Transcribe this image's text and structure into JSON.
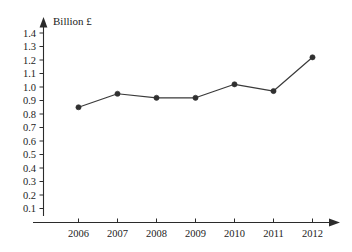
{
  "chart_data": {
    "type": "line",
    "title": "",
    "subtitle": "",
    "xlabel": "",
    "ylabel": "Billion £",
    "ylabel_position": "above-y-axis",
    "categories": [
      "2006",
      "2007",
      "2008",
      "2009",
      "2010",
      "2011",
      "2012"
    ],
    "x": [
      2006,
      2007,
      2008,
      2009,
      2010,
      2011,
      2012
    ],
    "values": [
      0.85,
      0.95,
      0.92,
      0.92,
      1.02,
      0.97,
      1.22
    ],
    "series": [
      {
        "name": "Billion £",
        "values": [
          0.85,
          0.95,
          0.92,
          0.92,
          1.02,
          0.97,
          1.22
        ]
      }
    ],
    "ylim": [
      0,
      1.45
    ],
    "xlim": [
      2005.4,
      2012.8
    ],
    "y_ticks": [
      0.1,
      0.2,
      0.3,
      0.4,
      0.5,
      0.6,
      0.7,
      0.8,
      0.9,
      1.0,
      1.1,
      1.2,
      1.3,
      1.4
    ],
    "y_tick_labels": [
      "0.1",
      "0.2",
      "0.3",
      "0.4",
      "0.5",
      "0.6",
      "0.7",
      "0.8",
      "0.9",
      "1.0",
      "1.1",
      "1.2",
      "1.3",
      "1.4"
    ],
    "y_tick_step": 0.1,
    "x_tick_labels": [
      "2006",
      "2007",
      "2008",
      "2009",
      "2010",
      "2011",
      "2012"
    ],
    "grid": false,
    "legend": false,
    "legend_position": "none",
    "markers": "filled-circle",
    "axis_arrows": [
      "x-right",
      "y-up"
    ],
    "annotations": [],
    "colors": {
      "line": "#3a3a3a",
      "marker": "#303030",
      "axis": "#2b2b2b",
      "text": "#1c1c1c",
      "background": "#ffffff"
    }
  }
}
